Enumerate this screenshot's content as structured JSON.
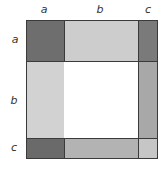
{
  "diagram": {
    "title": "",
    "column_labels": [
      "a",
      "b",
      "c"
    ],
    "row_labels": [
      "a",
      "b",
      "c"
    ],
    "colors": {
      "aa": "#6e6e6e",
      "ab": "#cdcdcd",
      "ac": "#7a7a7a",
      "ba": "#d2d2d2",
      "bb": "#ffffff",
      "bc": "#a8a8a8",
      "ca": "#6a6a6a",
      "cb": "#b3b3b3",
      "cc": "#c6c6c6"
    }
  }
}
